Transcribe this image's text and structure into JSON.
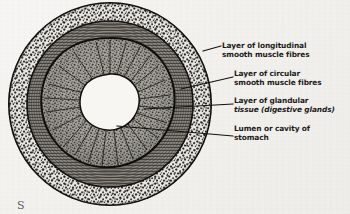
{
  "figure": {
    "background_color": "#f4f3f1",
    "ink_color": "#1b1a18",
    "caption_fragment": "S"
  },
  "labels": [
    {
      "id": "longitudinal",
      "name": "layer-of-longitudinal-smooth-muscle-fibres",
      "line1": "Layer of longitudinal",
      "line2": "smooth muscle fibres",
      "leader_from_x": 203,
      "leader_from_y": 51,
      "leader_to_x": 221,
      "leader_to_y": 46
    },
    {
      "id": "circular",
      "name": "layer-of-circular-smooth-muscle-fibres",
      "line1": "Layer of circular",
      "line2": "smooth muscle fibres",
      "leader_from_x": 181,
      "leader_from_y": 89,
      "leader_to_x": 233,
      "leader_to_y": 77
    },
    {
      "id": "glandular",
      "name": "layer-of-glandular-tissue",
      "line1": "Layer of glandular",
      "line2": "tissue (digestive glands)",
      "leader_from_x": 144,
      "leader_from_y": 109,
      "leader_to_x": 233,
      "leader_to_y": 104
    },
    {
      "id": "lumen",
      "name": "lumen-or-cavity-of-stomach",
      "line1": "Lumen or cavity of",
      "line2": "stomach",
      "leader_from_x": 117,
      "leader_from_y": 126,
      "leader_to_x": 233,
      "leader_to_y": 136
    }
  ],
  "chart_data": {
    "type": "diagram",
    "center_x": 110,
    "center_y": 104,
    "layers": [
      {
        "name": "Layer of longitudinal smooth muscle fibres",
        "texture": "coarse-stipple",
        "outer_radius": 102,
        "inner_radius": 83,
        "fill": "#cfcdc9"
      },
      {
        "name": "Layer of circular smooth muscle fibres",
        "texture": "fine-concentric-striations",
        "outer_radius": 83,
        "inner_radius": 66,
        "fill": "#8d8b87"
      },
      {
        "name": "Layer of glandular tissue (digestive glands)",
        "texture": "granular-radial-folds",
        "outer_radius": 66,
        "inner_radius": 30,
        "fill": "#9a9892"
      },
      {
        "name": "Lumen or cavity of stomach",
        "texture": "blank",
        "outer_radius": 30,
        "inner_radius": 0,
        "fill": "#f7f6f3"
      }
    ]
  }
}
